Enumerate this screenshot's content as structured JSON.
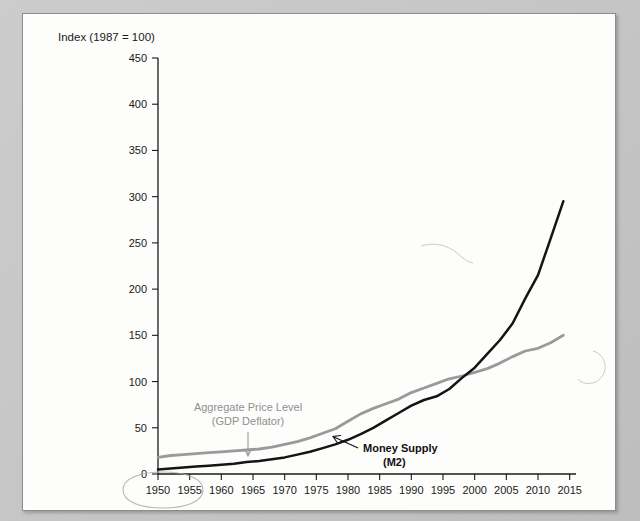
{
  "card": {
    "axis_note": "Index (1987 = 100)"
  },
  "annotations": {
    "deflator_label_line1": "Aggregate Price Level",
    "deflator_label_line2": "(GDP Deflator)",
    "m2_label_line1": "Money Supply",
    "m2_label_line2": "(M2)",
    "circled_year": "1950"
  },
  "colors": {
    "money_supply": "#141414",
    "price_level": "#9a9a9a",
    "page_background": "#c9c9c9",
    "card_background": "#fdfdfc",
    "pencil_mark": "#a9a9a9"
  },
  "chart_data": {
    "type": "line",
    "title": "",
    "subtitle": "",
    "xlabel": "",
    "ylabel": "Index (1987 = 100)",
    "xlim": [
      1950,
      2016
    ],
    "ylim": [
      0,
      450
    ],
    "ytick_step": 50,
    "xtick_step": 5,
    "grid": false,
    "legend": "annotated-inline",
    "yticks": [
      0,
      50,
      100,
      150,
      200,
      250,
      300,
      350,
      400,
      450
    ],
    "xticks": [
      1950,
      1955,
      1960,
      1965,
      1970,
      1975,
      1980,
      1985,
      1990,
      1995,
      2000,
      2005,
      2010,
      2015
    ],
    "x": [
      1950,
      1952,
      1954,
      1956,
      1958,
      1960,
      1962,
      1964,
      1966,
      1968,
      1970,
      1972,
      1974,
      1976,
      1978,
      1980,
      1982,
      1984,
      1986,
      1988,
      1990,
      1992,
      1994,
      1996,
      1998,
      2000,
      2002,
      2004,
      2006,
      2008,
      2010,
      2012,
      2014
    ],
    "series": [
      {
        "name": "Aggregate Price Level (GDP Deflator)",
        "color": "#9a9a9a",
        "values": [
          18,
          20,
          21,
          22,
          23,
          24,
          25,
          26,
          27,
          29,
          32,
          35,
          39,
          44,
          49,
          57,
          65,
          71,
          76,
          81,
          88,
          93,
          98,
          103,
          106,
          110,
          114,
          120,
          127,
          133,
          136,
          142,
          150
        ]
      },
      {
        "name": "Money Supply (M2)",
        "color": "#141414",
        "values": [
          5,
          6,
          7,
          8,
          9,
          10,
          11,
          13,
          14,
          16,
          18,
          21,
          24,
          28,
          32,
          37,
          43,
          50,
          58,
          66,
          74,
          80,
          84,
          92,
          104,
          115,
          130,
          145,
          163,
          190,
          215,
          255,
          295
        ]
      }
    ],
    "endpoints": {
      "money_supply_2014": 405,
      "price_level_2014": 180,
      "money_supply_1950": 5,
      "price_level_1950": 18,
      "crossover_year": 1989
    }
  }
}
